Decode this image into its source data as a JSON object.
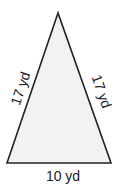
{
  "figure": {
    "shape": "isosceles-triangle",
    "fill_color": "#f2f2f2",
    "stroke_color": "#222222",
    "sides": {
      "left": "17 yd",
      "right": "17 yd",
      "base": "10 yd"
    }
  }
}
